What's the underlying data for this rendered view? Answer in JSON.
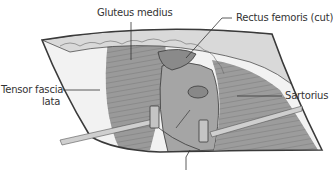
{
  "figure": {
    "labels": {
      "gluteus_medius": "Gluteus medius",
      "rectus_femoris": "Rectus femoris (cut)",
      "tensor_fascia_lata_line1": "Tensor fascia",
      "tensor_fascia_lata_line2": "lata",
      "sartorius": "Sartorius"
    },
    "colors": {
      "outline": "#3a3a3a",
      "skin_fat": "#d8d8d8",
      "muscle_dark": "#8c8c8c",
      "muscle_mid": "#a8a8a8",
      "capsule": "#9a9a9a",
      "fascia_light": "#f0f0f0",
      "retractor": "#c8c8c8"
    }
  }
}
